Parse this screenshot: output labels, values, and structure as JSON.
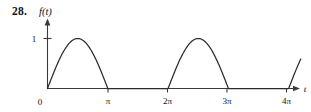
{
  "figure": {
    "problem_number": "28.",
    "function_label": "f(t)"
  },
  "chart_data": {
    "type": "line",
    "title": "",
    "subtitle": "",
    "xlabel": "t",
    "ylabel": "f(t)",
    "xlim": [
      0,
      14.5
    ],
    "ylim": [
      0,
      1.18
    ],
    "grid": false,
    "legend": null,
    "x_tick_labels": [
      "0",
      "π",
      "2π",
      "3π",
      "4π"
    ],
    "x_tick_values": [
      0,
      3.1416,
      6.2832,
      9.4248,
      12.5664
    ],
    "y_tick_labels": [
      "1"
    ],
    "y_tick_values": [
      1
    ],
    "origin_label": "0",
    "x_axis_arrow_label": "t",
    "series": [
      {
        "name": "f(t)",
        "description": "half-wave arch on [0,pi], zero on [pi,2pi], arch on [2pi,3pi], zero on [3pi,4pi], rising arch from 4pi",
        "x": [
          0,
          0.3927,
          0.7854,
          1.1781,
          1.5708,
          1.9635,
          2.3562,
          2.7489,
          3.1416,
          3.5343,
          3.927,
          4.3197,
          4.7124,
          5.1051,
          5.4978,
          5.8905,
          6.2832,
          6.6759,
          7.0686,
          7.4613,
          7.854,
          8.2467,
          8.6394,
          9.0321,
          9.4248,
          9.8175,
          10.2102,
          10.6029,
          10.9956,
          11.3883,
          11.781,
          12.1737,
          12.5664,
          12.959,
          13.3517,
          13.7444,
          14.1371
        ],
        "y": [
          0,
          0.3827,
          0.7071,
          0.9239,
          1,
          0.9239,
          0.7071,
          0.3827,
          0,
          0,
          0,
          0,
          0,
          0,
          0,
          0,
          0,
          0.3827,
          0.7071,
          0.9239,
          1,
          0.9239,
          0.7071,
          0.3827,
          0,
          0,
          0,
          0,
          0,
          0,
          0,
          0,
          0,
          0.3827,
          0.7071,
          0.9239,
          1
        ]
      }
    ]
  }
}
